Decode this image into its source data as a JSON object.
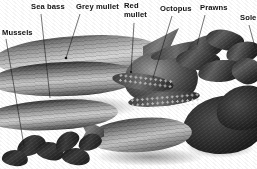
{
  "image": {
    "title": "Assorted fresh seafood display with labels",
    "style": "black-and-white photograph",
    "background_color": "#ffffff",
    "width": 257,
    "height": 169
  },
  "labels": [
    {
      "id": "mussels",
      "text": "Mussels",
      "x": 2,
      "y": 29,
      "line": {
        "x1": 6,
        "y1": 39,
        "x2": 24,
        "y2": 146
      }
    },
    {
      "id": "sea-bass",
      "text": "Sea bass",
      "x": 31,
      "y": 3,
      "line": {
        "x1": 41,
        "y1": 14,
        "x2": 50,
        "y2": 98
      }
    },
    {
      "id": "grey-mullet",
      "text": "Grey mullet",
      "x": 76,
      "y": 3,
      "line": {
        "x1": 80,
        "y1": 14,
        "x2": 66,
        "y2": 58
      }
    },
    {
      "id": "red-mullet",
      "text": "Red\nmullet",
      "x": 124,
      "y": 2,
      "line": {
        "x1": 134,
        "y1": 23,
        "x2": 131,
        "y2": 72
      }
    },
    {
      "id": "octopus",
      "text": "Octopus",
      "x": 160,
      "y": 5,
      "line": {
        "x1": 172,
        "y1": 16,
        "x2": 153,
        "y2": 78
      }
    },
    {
      "id": "prawns",
      "text": "Prawns",
      "x": 200,
      "y": 4,
      "line": {
        "x1": 205,
        "y1": 15,
        "x2": 197,
        "y2": 45
      }
    },
    {
      "id": "sole",
      "text": "Sole",
      "x": 240,
      "y": 14,
      "line": {
        "x1": 249,
        "y1": 25,
        "x2": 255,
        "y2": 47
      }
    }
  ],
  "label_style": {
    "color": "#111111",
    "font_size_px": 7.6,
    "font_weight": "bold",
    "leader_color": "#1a1a1a",
    "leader_width_px": 0.6
  },
  "subjects": [
    {
      "name": "mussels",
      "description": "cluster of dark shelled mussels, lower left"
    },
    {
      "name": "sea-bass",
      "description": "large silver sea bass, upper left, horizontal"
    },
    {
      "name": "grey-mullet",
      "description": "grey mullet body, centre left with striped flank"
    },
    {
      "name": "red-mullet",
      "description": "red mullet fish, lower centre"
    },
    {
      "name": "octopus",
      "description": "octopus with curled arms and suckers, centre right"
    },
    {
      "name": "prawns",
      "description": "dark prawns piled upper right"
    },
    {
      "name": "sole",
      "description": "dark flat sole fish, lower right"
    }
  ]
}
